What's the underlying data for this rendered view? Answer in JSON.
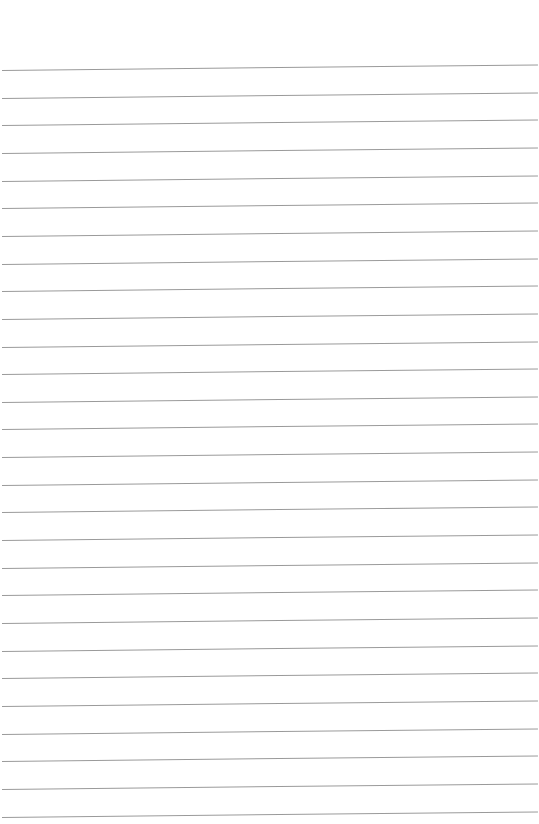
{
  "page": {
    "type": "lined-paper",
    "background_color": "#ffffff",
    "line_color": "#9a9a9a",
    "line_count": 28
  }
}
